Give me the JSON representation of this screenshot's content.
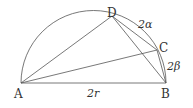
{
  "diagram": {
    "points": {
      "A": {
        "label": "A",
        "x": 21,
        "y": 83
      },
      "B": {
        "label": "B",
        "x": 166,
        "y": 83
      },
      "C": {
        "label": "C",
        "x": 157,
        "y": 50
      },
      "D": {
        "label": "D",
        "x": 112,
        "y": 15
      }
    },
    "arc_labels": {
      "DC": "2α",
      "CB": "2β"
    },
    "segment_labels": {
      "AB": "2r"
    },
    "stroke_color": "#555555"
  }
}
